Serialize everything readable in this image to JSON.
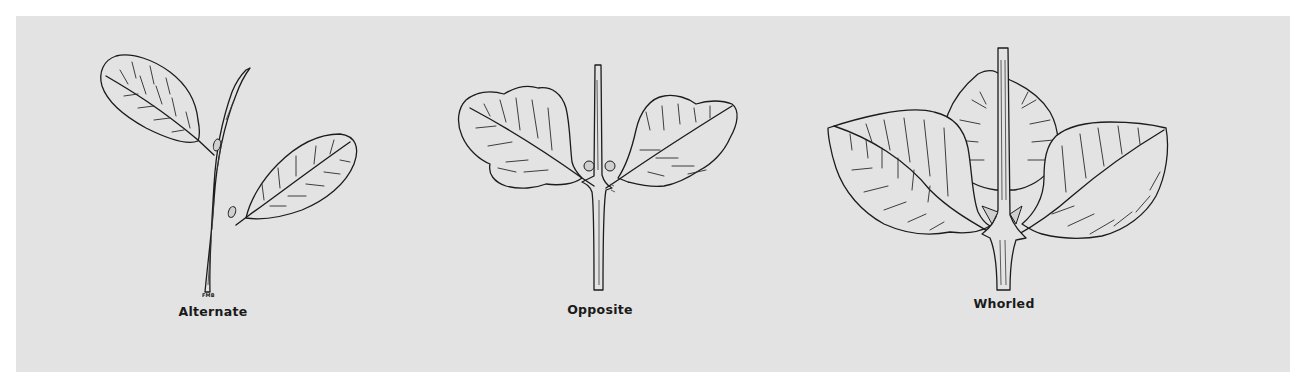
{
  "figure": {
    "background_color": "#e3e3e3",
    "line_color": "#1c1c1c",
    "illustrations": [
      {
        "id": "alternate",
        "label": "Alternate",
        "leaf_count": 2,
        "signature": "FMB"
      },
      {
        "id": "opposite",
        "label": "Opposite",
        "leaf_count": 2
      },
      {
        "id": "whorled",
        "label": "Whorled",
        "leaf_count": 3
      }
    ]
  }
}
